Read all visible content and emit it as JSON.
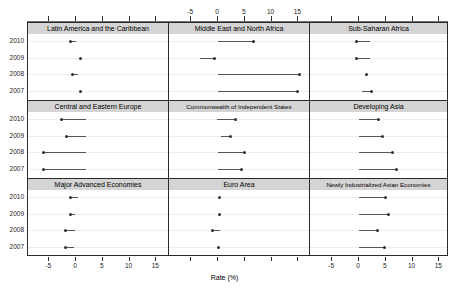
{
  "chart_data": {
    "type": "scatter",
    "title": "",
    "xlabel": "Rate (%)",
    "ylabel": "",
    "xlim": [
      -8,
      17
    ],
    "xticks": [
      -5,
      0,
      5,
      10,
      15
    ],
    "xticklabels": [
      "-5",
      "0",
      "5",
      "10",
      "15"
    ],
    "categories": [
      "2010",
      "2009",
      "2008",
      "2007"
    ],
    "grid": true,
    "legend": "none",
    "layout": {
      "rows": 3,
      "cols": 3
    },
    "panels": [
      {
        "title": "Latin America and the Caribbean",
        "row": 0,
        "col": 0,
        "points": [
          {
            "year": "2010",
            "value": -1.1,
            "line_to": 0.0
          },
          {
            "year": "2009",
            "value": 0.9,
            "line_to": 0.9
          },
          {
            "year": "2008",
            "value": -0.6,
            "line_to": 0.4
          },
          {
            "year": "2007",
            "value": 0.9,
            "line_to": 0.9
          }
        ]
      },
      {
        "title": "Middle East and North Africa",
        "row": 0,
        "col": 1,
        "points": [
          {
            "year": "2010",
            "value": 6.6,
            "line_to": 0.0
          },
          {
            "year": "2009",
            "value": -0.6,
            "line_to": -3.4
          },
          {
            "year": "2008",
            "value": 15.2,
            "line_to": 0.0
          },
          {
            "year": "2007",
            "value": 14.8,
            "line_to": 0.0
          }
        ]
      },
      {
        "title": "Sub-Saharan Africa",
        "row": 0,
        "col": 2,
        "points": [
          {
            "year": "2010",
            "value": -0.4,
            "line_to": 2.0
          },
          {
            "year": "2009",
            "value": -0.4,
            "line_to": 2.0
          },
          {
            "year": "2008",
            "value": 1.4,
            "line_to": 1.4
          },
          {
            "year": "2007",
            "value": 2.4,
            "line_to": 0.6
          }
        ]
      },
      {
        "title": "Central and Eastern Europe",
        "row": 1,
        "col": 0,
        "points": [
          {
            "year": "2010",
            "value": -2.7,
            "line_to": 1.8
          },
          {
            "year": "2009",
            "value": -1.8,
            "line_to": 1.8
          },
          {
            "year": "2008",
            "value": -6.0,
            "line_to": 1.8
          },
          {
            "year": "2007",
            "value": -6.0,
            "line_to": 1.8
          }
        ]
      },
      {
        "title": "Commonwealth of Independent States",
        "row": 1,
        "col": 1,
        "points": [
          {
            "year": "2010",
            "value": 3.2,
            "line_to": -0.1
          },
          {
            "year": "2009",
            "value": 2.4,
            "line_to": 0.6
          },
          {
            "year": "2008",
            "value": 5.0,
            "line_to": 0.0
          },
          {
            "year": "2007",
            "value": 4.4,
            "line_to": 0.0
          }
        ]
      },
      {
        "title": "Developing Asia",
        "row": 1,
        "col": 2,
        "points": [
          {
            "year": "2010",
            "value": 3.6,
            "line_to": 0.0
          },
          {
            "year": "2009",
            "value": 4.4,
            "line_to": 0.0
          },
          {
            "year": "2008",
            "value": 6.3,
            "line_to": 0.0
          },
          {
            "year": "2007",
            "value": 7.1,
            "line_to": 0.0
          }
        ]
      },
      {
        "title": "Major Advanced Economies",
        "row": 2,
        "col": 0,
        "points": [
          {
            "year": "2010",
            "value": -1.1,
            "line_to": 0.3
          },
          {
            "year": "2009",
            "value": -1.1,
            "line_to": -0.2
          },
          {
            "year": "2008",
            "value": -1.9,
            "line_to": -0.2
          },
          {
            "year": "2007",
            "value": -1.9,
            "line_to": -0.4
          }
        ]
      },
      {
        "title": "Euro Area",
        "row": 2,
        "col": 1,
        "points": [
          {
            "year": "2010",
            "value": 0.2,
            "line_to": 0.2
          },
          {
            "year": "2009",
            "value": 0.2,
            "line_to": 0.2
          },
          {
            "year": "2008",
            "value": -1.1,
            "line_to": 0.4
          },
          {
            "year": "2007",
            "value": 0.0,
            "line_to": 0.0
          }
        ]
      },
      {
        "title": "Newly Industrialized Asian Economies",
        "row": 2,
        "col": 2,
        "points": [
          {
            "year": "2010",
            "value": 5.0,
            "line_to": 0.0
          },
          {
            "year": "2009",
            "value": 5.6,
            "line_to": 0.0
          },
          {
            "year": "2008",
            "value": 3.4,
            "line_to": 0.0
          },
          {
            "year": "2007",
            "value": 4.8,
            "line_to": 0.0
          }
        ]
      }
    ]
  },
  "axis": {
    "top_ticklabels": [
      "-5",
      "0",
      "5",
      "10",
      "15"
    ],
    "bottom_ticklabels": [
      "-5",
      "0",
      "5",
      "10",
      "15"
    ],
    "xaxis_title": "Rate (%)"
  },
  "rows": {
    "labels": [
      "2010",
      "2009",
      "2008",
      "2007"
    ]
  }
}
